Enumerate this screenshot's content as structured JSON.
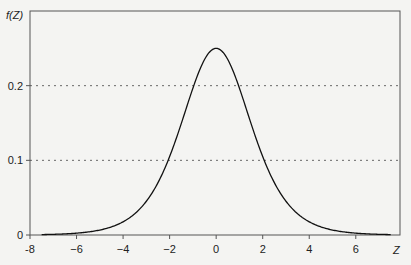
{
  "chart_data": {
    "type": "line",
    "title": "",
    "xlabel": "Z",
    "ylabel": "f(Z)",
    "xlim": [
      -8,
      7.9
    ],
    "ylim": [
      0,
      0.3
    ],
    "xticks": [
      -8,
      -6,
      -4,
      -2,
      0,
      2,
      4,
      6
    ],
    "xtick_labels": [
      "-8",
      "−6",
      "−4",
      "−2",
      "0",
      "2",
      "4",
      "6"
    ],
    "yticks": [
      0,
      0.1,
      0.2
    ],
    "ytick_labels": [
      "0",
      "0.1",
      "0.2"
    ],
    "grid": "dotted horizontal lines at y=0.1 and y=0.2",
    "legend": null,
    "series": [
      {
        "name": "f(Z)",
        "description": "Standard logistic probability density, peak 0.25 at Z=0",
        "x": [
          -7.5,
          -7,
          -6,
          -5,
          -4,
          -3,
          -2.5,
          -2,
          -1.5,
          -1,
          -0.5,
          0,
          0.5,
          1,
          1.5,
          2,
          2.5,
          3,
          4,
          5,
          6,
          7,
          7.5
        ],
        "values": [
          0.0006,
          0.0009,
          0.0025,
          0.0066,
          0.0177,
          0.0452,
          0.0701,
          0.105,
          0.1491,
          0.1966,
          0.235,
          0.25,
          0.235,
          0.1966,
          0.1491,
          0.105,
          0.0701,
          0.0452,
          0.0177,
          0.0066,
          0.0025,
          0.0009,
          0.0006
        ]
      }
    ]
  }
}
